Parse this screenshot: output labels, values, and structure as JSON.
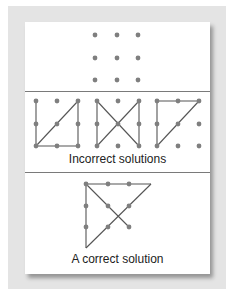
{
  "colors": {
    "background": "#ffffff",
    "panel": "#e4e4e4",
    "card": "#ffffff",
    "dot": "#7f7f7f",
    "line": "#555555",
    "divider": "#7a7a7a"
  },
  "puzzle": {
    "title": "Nine-dot problem",
    "grid": {
      "cols": [
        95,
        117,
        138
      ],
      "rows": [
        35,
        58,
        80
      ]
    }
  },
  "incorrect": {
    "label": "Incorrect solutions",
    "panels": [
      {
        "cols": [
          36,
          57,
          78
        ],
        "rows": [
          101,
          124,
          146
        ],
        "lines": [
          [
            36,
            101,
            36,
            146
          ],
          [
            36,
            146,
            78,
            101
          ],
          [
            36,
            146,
            78,
            146
          ],
          [
            78,
            101,
            78,
            146
          ]
        ]
      },
      {
        "cols": [
          97,
          118,
          139
        ],
        "rows": [
          101,
          124,
          146
        ],
        "lines": [
          [
            97,
            101,
            97,
            146
          ],
          [
            97,
            101,
            139,
            146
          ],
          [
            97,
            146,
            139,
            101
          ],
          [
            139,
            101,
            139,
            146
          ]
        ]
      },
      {
        "cols": [
          157,
          178,
          199
        ],
        "rows": [
          101,
          124,
          146
        ],
        "lines": [
          [
            157,
            101,
            199,
            101
          ],
          [
            157,
            101,
            157,
            146
          ],
          [
            157,
            146,
            199,
            101
          ]
        ]
      }
    ]
  },
  "correct": {
    "label": "A correct solution",
    "cols": [
      86,
      108,
      129
    ],
    "rows": [
      184,
      206,
      227
    ],
    "lines": [
      [
        86,
        248,
        86,
        184
      ],
      [
        86,
        184,
        151,
        184
      ],
      [
        151,
        184,
        86,
        248
      ],
      [
        86,
        184,
        129,
        227
      ]
    ]
  }
}
